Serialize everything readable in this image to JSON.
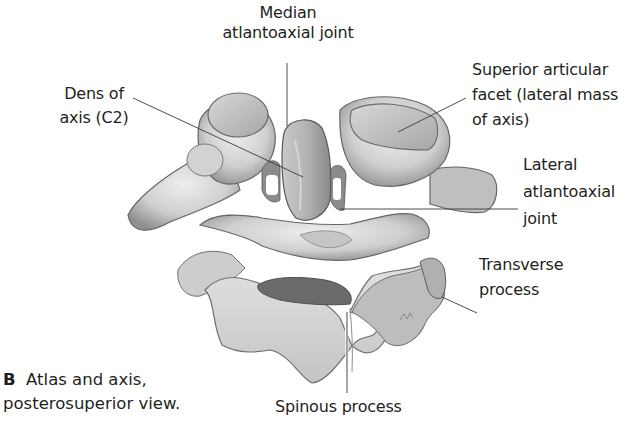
{
  "figure": {
    "caption": {
      "letter": "B",
      "line1": "Atlas and axis,",
      "line2": "posterosuperior view."
    },
    "labels": [
      {
        "id": "median-atlantoaxial-joint",
        "lines": [
          "Median",
          "atlantoaxial joint"
        ]
      },
      {
        "id": "dens-of-axis",
        "lines": [
          "Dens of",
          "axis (C2)"
        ]
      },
      {
        "id": "superior-articular-facet",
        "lines": [
          "Superior articular",
          "facet (lateral mass",
          "of axis)"
        ]
      },
      {
        "id": "lateral-atlantoaxial-joint",
        "lines": [
          "Lateral",
          "atlantoaxial",
          "joint"
        ]
      },
      {
        "id": "transverse-process",
        "lines": [
          "Transverse",
          "process"
        ]
      },
      {
        "id": "spinous-process",
        "lines": [
          "Spinous process"
        ]
      }
    ],
    "colors": {
      "text": "#231f20",
      "leader_line": "#3a3a3a",
      "bone_light": "#e6e6e6",
      "bone_mid": "#b9b9b9",
      "bone_dark": "#7d7d7d",
      "bone_shadow": "#555555"
    }
  }
}
